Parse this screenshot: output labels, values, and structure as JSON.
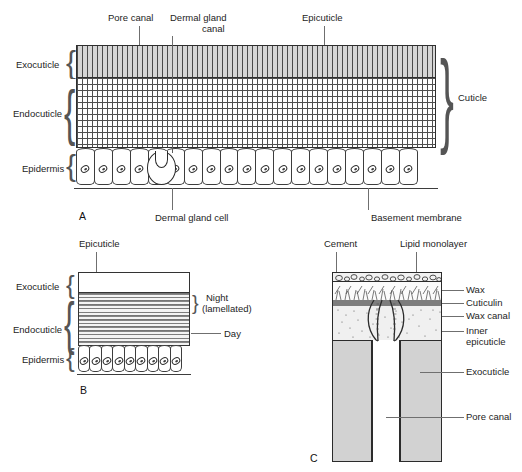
{
  "figure": {
    "panels": [
      {
        "id": "A",
        "letter": "A",
        "caption": "Generalised vertical section through insect integument"
      },
      {
        "id": "B",
        "letter": "B",
        "caption": "Daily growth layers of endocuticle"
      },
      {
        "id": "C",
        "letter": "C",
        "caption": "Detail of epicuticle and wax canals"
      }
    ]
  },
  "panelA": {
    "letter": "A",
    "top_labels": [
      {
        "name": "pore-canal",
        "text": "Pore canal"
      },
      {
        "name": "dermal-gland-canal",
        "text": "Dermal gland\ncanal",
        "line1": "Dermal gland",
        "line2": "canal"
      },
      {
        "name": "epicuticle",
        "text": "Epicuticle"
      }
    ],
    "left_labels": [
      {
        "name": "exocuticle",
        "text": "Exocuticle"
      },
      {
        "name": "endocuticle",
        "text": "Endocuticle"
      },
      {
        "name": "epidermis",
        "text": "Epidermis"
      }
    ],
    "right_labels": [
      {
        "name": "cuticle",
        "text": "Cuticle"
      }
    ],
    "bottom_labels": [
      {
        "name": "dermal-gland-cell",
        "text": "Dermal gland cell"
      },
      {
        "name": "basement-membrane",
        "text": "Basement membrane"
      }
    ],
    "epidermis_cell_count": 19,
    "gland_cell_index": 4
  },
  "panelB": {
    "letter": "B",
    "top_labels": [
      {
        "name": "epicuticle",
        "text": "Epicuticle"
      }
    ],
    "left_labels": [
      {
        "name": "exocuticle",
        "text": "Exocuticle"
      },
      {
        "name": "endocuticle",
        "text": "Endocuticle"
      },
      {
        "name": "epidermis",
        "text": "Epidermis"
      }
    ],
    "right_labels": [
      {
        "name": "night",
        "line1": "Night",
        "line2": "(lamellated)"
      },
      {
        "name": "day",
        "text": "Day"
      }
    ],
    "epidermis_cell_count": 9,
    "lamella_band_count": 14
  },
  "panelC": {
    "letter": "C",
    "top_labels": [
      {
        "name": "cement",
        "text": "Cement"
      },
      {
        "name": "lipid-monolayer",
        "text": "Lipid monolayer"
      }
    ],
    "right_labels": [
      {
        "name": "wax",
        "text": "Wax"
      },
      {
        "name": "cuticulin",
        "text": "Cuticulin"
      },
      {
        "name": "wax-canal",
        "text": "Wax canal"
      },
      {
        "name": "inner-epicuticle",
        "line1": "Inner",
        "line2": "epicuticle"
      },
      {
        "name": "exocuticle",
        "text": "Exocuticle"
      },
      {
        "name": "pore-canal",
        "text": "Pore canal"
      }
    ]
  },
  "colors": {
    "ink": "#242424",
    "line": "#6f6f6f",
    "exocuticle_fill": "#d6d6d6",
    "cuticulin_fill": "#7d7d7d",
    "inner_epicuticle_fill": "#f0f0f0",
    "panelC_exocuticle_fill": "#d2d2d2",
    "background": "#ffffff"
  }
}
